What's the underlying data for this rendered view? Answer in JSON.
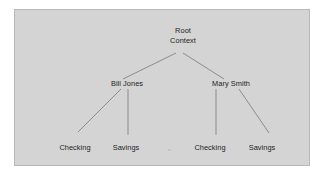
{
  "panel": {
    "background_color": "#d4d4d4",
    "border_color": "#b9b9b9",
    "outer_background_color": "#ffffff"
  },
  "diagram": {
    "type": "tree",
    "line_color": "#8c8c8c",
    "text_color": "#1d1d1d",
    "nodes": {
      "root": {
        "line1": "Root",
        "line2": "Context"
      },
      "children": [
        {
          "label": "Bill Jones",
          "leaves": [
            {
              "label": "Checking"
            },
            {
              "label": "Savings"
            }
          ]
        },
        {
          "label": "Mary Smith",
          "leaves": [
            {
              "label": "Checking"
            },
            {
              "label": "Savings"
            }
          ]
        }
      ]
    }
  }
}
